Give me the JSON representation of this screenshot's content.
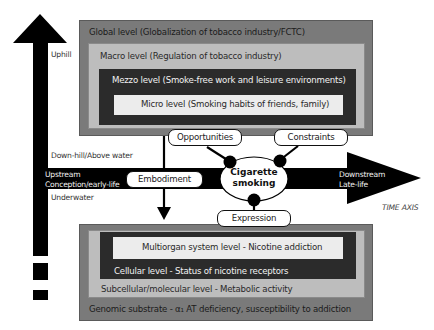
{
  "vertical_axis": {
    "uphill_label": "Uphill",
    "downhill_label": "Down-hill/Above water",
    "underwater_label": "Underwater"
  },
  "time_axis": {
    "upstream_line1": "Upstream",
    "upstream_line2": "Conception/early-life",
    "downstream_line1": "Downstream",
    "downstream_line2": "Late-life",
    "axis_label": "TIME AXIS"
  },
  "upper_levels": {
    "global": "Global level (Globalization of tobacco industry/FCTC)",
    "macro": "Macro level (Regulation of tobacco industry)",
    "mezzo": "Mezzo level (Smoke-free work and leisure environments)",
    "micro": "Micro level (Smoking habits of friends, family)"
  },
  "lower_levels": {
    "multiorgan": "Multiorgan system level - Nicotine addiction",
    "cellular": "Cellular level - Status of nicotine receptors",
    "subcellular": "Subcellular/molecular level - Metabolic activity",
    "genomic": "Genomic substrate - α₁ AT deficiency, susceptibility to addiction"
  },
  "center": {
    "line1": "Cigarette",
    "line2": "smoking"
  },
  "connectors": {
    "opportunities": "Opportunities",
    "constraints": "Constraints",
    "embodiment": "Embodiment",
    "expression": "Expression"
  },
  "colors": {
    "outer_box": "#7a7a7a",
    "second_box": "#bdbdbd",
    "third_box": "#2b2b2b",
    "inner_box": "#ececec",
    "arrow": "#000000"
  }
}
